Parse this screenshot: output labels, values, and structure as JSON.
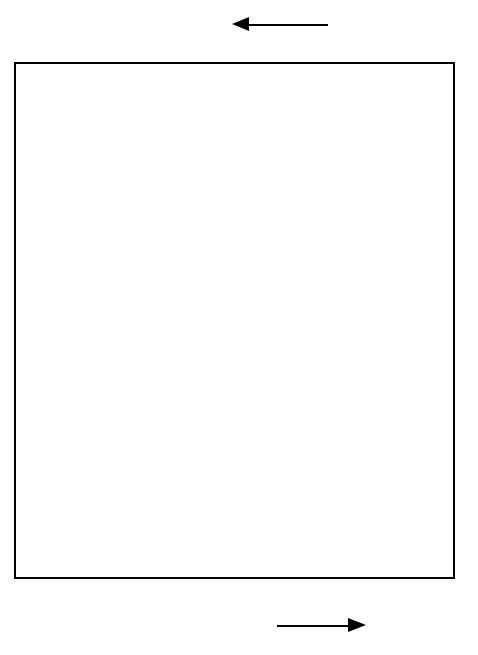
{
  "chart_data": {
    "type": "scatter",
    "title": "",
    "xlabel": "D",
    "ylabel": "",
    "top_axis": {
      "label": "I",
      "arrow_direction": "left",
      "ticks": [
        {
          "label": "1",
          "d": 0.0
        },
        {
          "label": "0,5",
          "d": 0.62
        },
        {
          "label": "0,2",
          "d": 1.32
        }
      ],
      "minor_tick_count": 9
    },
    "bottom_axis": {
      "label": "D",
      "arrow_direction": "right",
      "ticks": [
        "0",
        "0,4",
        "0,8",
        "1,2",
        "1,6",
        "2,0"
      ],
      "xlim": [
        0,
        2.0
      ],
      "minor_step": 0.2
    },
    "grid": false,
    "legend": "none",
    "footnote": "*(Zwillingsarten)",
    "groups": [
      {
        "category": "Subspecies",
        "rows": [
          {
            "label": "Drosophila",
            "value": 0.05,
            "low": null,
            "high": null,
            "marker": "filled"
          },
          {
            "label": "Fische",
            "value": 0.09,
            "low": 0.03,
            "high": 0.15,
            "marker": "filled"
          },
          {
            "label": "Eidechsen",
            "value": 0.08,
            "low": null,
            "high": null,
            "marker": "filled"
          },
          {
            "label": "Säuger",
            "value": 0.27,
            "low": 0.18,
            "high": 0.36,
            "marker": "filled"
          }
        ]
      },
      {
        "category": "Species",
        "rows": [
          {
            "label": "Drosophila*",
            "value": 0.4,
            "low": 0.12,
            "high": 0.73,
            "marker": "filled"
          },
          {
            "label": "Drosophila",
            "value": 1.38,
            "low": 1.0,
            "high": 1.8,
            "marker": "filled"
          },
          {
            "label": "Seesterne",
            "value": 0.37,
            "low": null,
            "high": null,
            "marker": "filled"
          },
          {
            "label": "Fische",
            "value": 0.41,
            "low": 0.11,
            "high": 0.72,
            "marker": "filled"
          },
          {
            "label": "Salamander",
            "value": 0.27,
            "low": null,
            "high": null,
            "marker": "filled"
          },
          {
            "label": "Eidechsen",
            "value": 0.79,
            "low": 0.34,
            "high": 1.41,
            "marker": "filled"
          },
          {
            "label": "Säuger",
            "value": 0.34,
            "low": 0.17,
            "high": 0.53,
            "marker": "filled"
          }
        ]
      },
      {
        "category": "Gattungen",
        "rows": [
          {
            "label": "Seesterne",
            "value": 1.37,
            "low": null,
            "high": null,
            "marker": "filled"
          },
          {
            "label": "Fische",
            "value": 1.75,
            "low": null,
            "high": null,
            "marker": "filled"
          },
          {
            "label": "Salamander",
            "value": 1.14,
            "low": null,
            "high": null,
            "marker": "filled"
          },
          {
            "label": "Säuger",
            "value": 1.81,
            "low": null,
            "high": null,
            "marker": "filled"
          }
        ]
      },
      {
        "category": "Familien",
        "rows": [
          {
            "label": "Hominiden/",
            "label2": "Pongiden",
            "value": 0.36,
            "low": 0.32,
            "high": 0.4,
            "marker": "open"
          },
          {
            "label": "Hominiden/",
            "label2": "Hylobatiden",
            "value": 0.85,
            "low": 0.7,
            "high": 1.0,
            "marker": "open"
          },
          {
            "label": "Pongiden/",
            "label2": "Hylobatiden",
            "value": 0.73,
            "low": 0.56,
            "high": 1.0,
            "marker": "open"
          }
        ]
      }
    ]
  }
}
